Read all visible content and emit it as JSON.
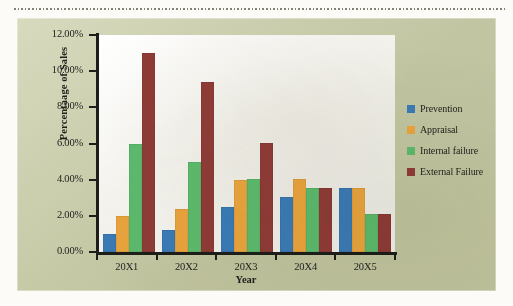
{
  "chart_data": {
    "type": "bar",
    "title": "",
    "xlabel": "Year",
    "ylabel": "Percentaage of Sales",
    "categories": [
      "20X1",
      "20X2",
      "20X3",
      "20X4",
      "20X5"
    ],
    "series": [
      {
        "name": "Prevention",
        "color": "#3a7ab5",
        "values": [
          1.0,
          1.2,
          2.5,
          3.05,
          3.55
        ]
      },
      {
        "name": "Appraisal",
        "color": "#e8a33d",
        "values": [
          2.0,
          2.4,
          4.0,
          4.05,
          3.55
        ]
      },
      {
        "name": "Internal failure",
        "color": "#5cb96c",
        "values": [
          6.0,
          5.0,
          4.05,
          3.55,
          2.1
        ]
      },
      {
        "name": "External Failure",
        "color": "#8e3b36",
        "values": [
          11.0,
          9.4,
          6.05,
          3.55,
          2.1
        ]
      }
    ],
    "ylim": [
      0,
      12
    ],
    "ytick_values": [
      0,
      2,
      4,
      6,
      8,
      10,
      12
    ],
    "ytick_labels": [
      "0.00%",
      "2.00%",
      "4.00%",
      "6.00%",
      "8.00%",
      "10.00%",
      "12.00%"
    ],
    "grid": false,
    "legend_position": "right",
    "units": "percent"
  },
  "panel": {
    "background_color": "#ccd0ab",
    "plot_background_color": "#f7f6f2"
  }
}
